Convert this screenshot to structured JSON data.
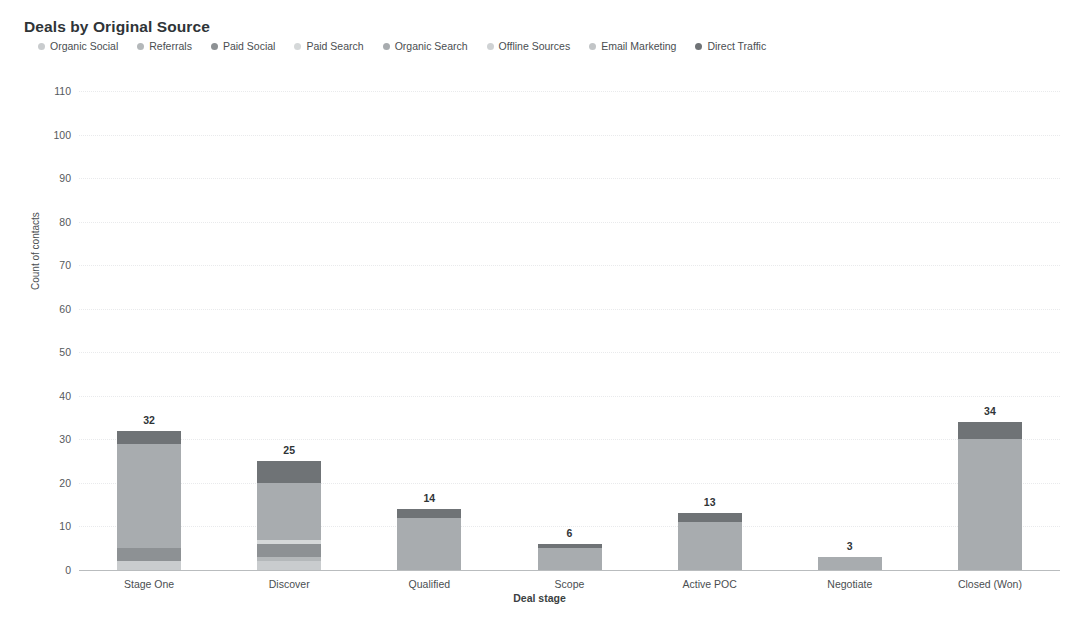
{
  "chart_data": {
    "type": "bar",
    "subtype": "stacked-column",
    "title": "Deals by Original Source",
    "xlabel": "Deal stage",
    "ylabel": "Count of contacts",
    "ylim": [
      0,
      110
    ],
    "ytick_step": 10,
    "yticks": [
      0,
      10,
      20,
      30,
      40,
      50,
      60,
      70,
      80,
      90,
      100,
      110
    ],
    "grid": true,
    "legend_position": "top",
    "categories": [
      "Stage One",
      "Discover",
      "Qualified",
      "Scope",
      "Active POC",
      "Negotiate",
      "Closed (Won)"
    ],
    "totals": [
      32,
      25,
      14,
      6,
      13,
      3,
      34
    ],
    "series": [
      {
        "name": "Organic Social",
        "color": "#c9ccce",
        "values": [
          2,
          2,
          0,
          0,
          0,
          0,
          0
        ]
      },
      {
        "name": "Referrals",
        "color": "#b4b8ba",
        "values": [
          0,
          1,
          0,
          0,
          0,
          0,
          0
        ]
      },
      {
        "name": "Paid Social",
        "color": "#8d9194",
        "values": [
          3,
          3,
          0,
          0,
          0,
          0,
          0
        ]
      },
      {
        "name": "Paid Search",
        "color": "#d5d8d9",
        "values": [
          0,
          1,
          0,
          0,
          0,
          0,
          0
        ]
      },
      {
        "name": "Organic Search",
        "color": "#a8acaf",
        "values": [
          24,
          13,
          12,
          5,
          11,
          3,
          30
        ]
      },
      {
        "name": "Offline Sources",
        "color": "#cfd2d4",
        "values": [
          0,
          0,
          0,
          0,
          0,
          0,
          0
        ]
      },
      {
        "name": "Email Marketing",
        "color": "#c2c5c7",
        "values": [
          0,
          0,
          0,
          0,
          0,
          0,
          0
        ]
      },
      {
        "name": "Direct Traffic",
        "color": "#6f7376",
        "values": [
          3,
          5,
          2,
          1,
          2,
          0,
          4
        ]
      }
    ]
  },
  "legend": {
    "items": [
      {
        "label": "Organic Social",
        "color": "#c9ccce"
      },
      {
        "label": "Referrals",
        "color": "#b4b8ba"
      },
      {
        "label": "Paid Social",
        "color": "#8d9194"
      },
      {
        "label": "Paid Search",
        "color": "#d5d8d9"
      },
      {
        "label": "Organic Search",
        "color": "#a8acaf"
      },
      {
        "label": "Offline Sources",
        "color": "#cfd2d4"
      },
      {
        "label": "Email Marketing",
        "color": "#c2c5c7"
      },
      {
        "label": "Direct Traffic",
        "color": "#6f7376"
      }
    ]
  }
}
